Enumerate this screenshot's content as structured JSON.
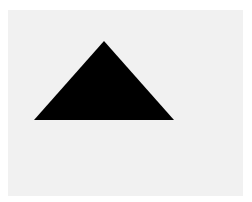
{
  "canvas": {
    "background": "#ffffff",
    "panel_color": "#f1f1f1"
  },
  "shape": {
    "type": "triangle",
    "icon": "triangle-up-icon",
    "fill": "#000000",
    "points": "34,120 104,41 174,120"
  }
}
